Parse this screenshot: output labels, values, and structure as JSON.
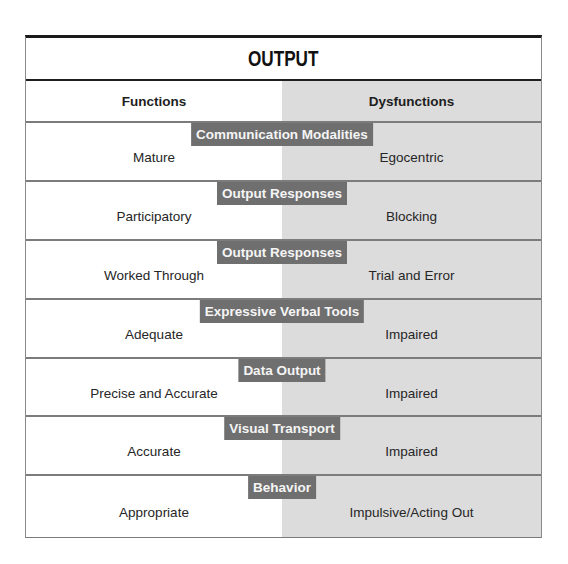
{
  "title": "OUTPUT",
  "columns": {
    "functions": "Functions",
    "dysfunctions": "Dysfunctions"
  },
  "rows": [
    {
      "category": "Communication Modalities",
      "function": "Mature",
      "dysfunction": "Egocentric"
    },
    {
      "category": "Output Responses",
      "function": "Participatory",
      "dysfunction": "Blocking"
    },
    {
      "category": "Output Responses",
      "function": "Worked Through",
      "dysfunction": "Trial and Error"
    },
    {
      "category": "Expressive Verbal Tools",
      "function": "Adequate",
      "dysfunction": "Impaired"
    },
    {
      "category": "Data Output",
      "function": "Precise and Accurate",
      "dysfunction": "Impaired"
    },
    {
      "category": "Visual Transport",
      "function": "Accurate",
      "dysfunction": "Impaired"
    },
    {
      "category": "Behavior",
      "function": "Appropriate",
      "dysfunction": "Impulsive/Acting Out"
    }
  ],
  "colors": {
    "tag_background": "#6f6f6f",
    "dysfunction_column": "#dcdcdc",
    "separator": "#7c7c7c",
    "title_border": "#1a1a1a"
  }
}
